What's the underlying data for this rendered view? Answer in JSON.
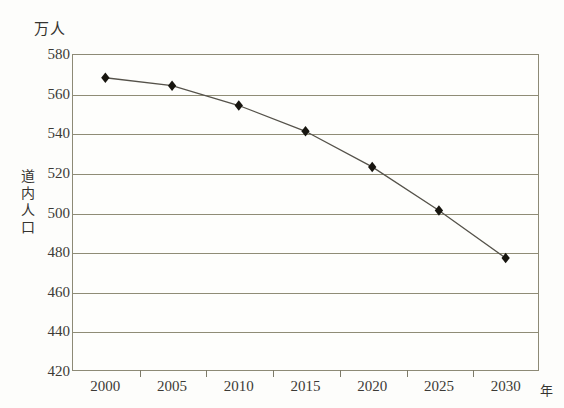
{
  "chart_data": {
    "type": "line",
    "title": "",
    "xlabel": "年",
    "ylabel": "道内人口",
    "yunit": "万人",
    "categories": [
      "2000",
      "2005",
      "2010",
      "2015",
      "2020",
      "2025",
      "2030"
    ],
    "values": [
      568,
      564,
      554,
      541,
      523,
      501,
      477
    ],
    "series": [
      {
        "name": "道内人口",
        "values": [
          568,
          564,
          554,
          541,
          523,
          501,
          477
        ]
      }
    ],
    "ylim": [
      420,
      580
    ],
    "ytick_values": [
      580,
      560,
      540,
      520,
      500,
      480,
      460,
      440,
      420
    ],
    "ytick_labels": [
      "580",
      "560",
      "540",
      "520",
      "500",
      "480",
      "460",
      "440",
      "420"
    ],
    "xtick_labels": [
      "2000",
      "2005",
      "2010",
      "2015",
      "2020",
      "2025",
      "2030"
    ],
    "grid": true,
    "legend": false,
    "marker": "diamond",
    "line_color": "#55524a",
    "marker_color": "#17150f",
    "grid_color": "#8f8c76",
    "axis_color": "#8d8a76",
    "background": "#fdfdfb"
  },
  "axis": {
    "y_unit_label": "万人",
    "y_title_chars": [
      "道",
      "内",
      "人",
      "口"
    ],
    "x_unit_label": "年"
  }
}
